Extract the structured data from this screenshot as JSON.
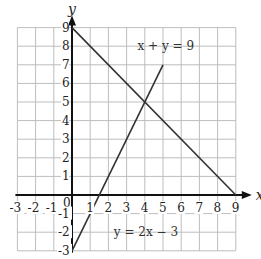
{
  "chart_data": {
    "type": "line",
    "title": "",
    "xlabel": "x",
    "ylabel": "y",
    "xlim": [
      -3,
      9
    ],
    "ylim": [
      -3,
      9
    ],
    "grid": true,
    "x_ticks": [
      "-3",
      "-2",
      "-1",
      "0",
      "1",
      "2",
      "3",
      "4",
      "5",
      "6",
      "7",
      "8",
      "9"
    ],
    "y_ticks": [
      "-3",
      "-2",
      "-1",
      "1",
      "2",
      "3",
      "4",
      "5",
      "6",
      "7",
      "8",
      "9"
    ],
    "series": [
      {
        "name": "x + y = 9",
        "points": [
          [
            0,
            9
          ],
          [
            9,
            0
          ]
        ]
      },
      {
        "name": "y = 2x − 3",
        "points": [
          [
            0,
            -3
          ],
          [
            5,
            7
          ]
        ]
      }
    ],
    "annotations": [
      {
        "text": "x + y = 9",
        "x": 3.6,
        "y": 8
      },
      {
        "text": "y = 2x − 3",
        "x": 2.3,
        "y": -2
      }
    ]
  }
}
